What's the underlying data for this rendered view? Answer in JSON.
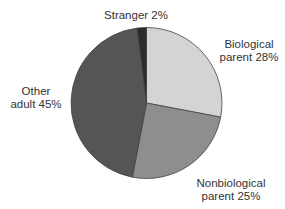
{
  "chart_data": {
    "type": "pie",
    "title": "",
    "categories": [
      "Biological parent",
      "Nonbiological parent",
      "Other adult",
      "Stranger"
    ],
    "values": [
      28,
      25,
      45,
      2
    ],
    "unit": "%",
    "start_angle_deg": 0,
    "direction": "clockwise",
    "colors": [
      "#d4d4d4",
      "#8e8e8e",
      "#555555",
      "#2b2b2b"
    ],
    "stroke": "#444444",
    "legend": "none (labels placed beside slices)",
    "labels": [
      {
        "line1": "Biological",
        "line2": "parent 28%"
      },
      {
        "line1": "Nonbiological",
        "line2": "parent 25%"
      },
      {
        "line1": "Other",
        "line2": "adult 45%"
      },
      {
        "line1": "Stranger 2%",
        "line2": ""
      }
    ]
  }
}
